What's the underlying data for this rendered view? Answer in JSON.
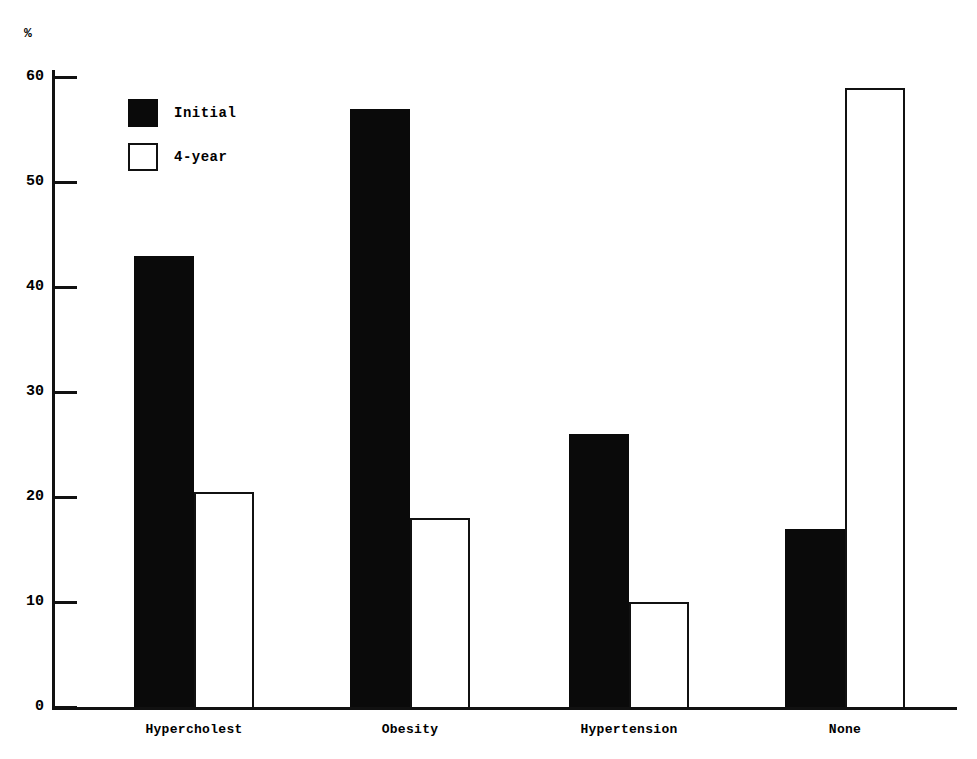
{
  "chart_data": {
    "type": "bar",
    "title": "",
    "xlabel": "",
    "ylabel": "%",
    "ylim": [
      0,
      60
    ],
    "yticks": [
      0,
      10,
      20,
      30,
      40,
      50,
      60
    ],
    "ytick_labels": [
      "0",
      "10",
      "20",
      "30",
      "40",
      "50",
      "60"
    ],
    "grid": false,
    "legend_position": "upper-left-inside",
    "categories": [
      "Hypercholest",
      "Obesity",
      "Hypertension",
      "None"
    ],
    "series": [
      {
        "name": "Initial",
        "style": "filled-black",
        "color": "#0a0a0a",
        "values": [
          43.0,
          57.0,
          26.0,
          17.0
        ]
      },
      {
        "name": "4-year",
        "style": "hollow-outline",
        "color": "#ffffff",
        "edgecolor": "#111111",
        "values": [
          20.5,
          18.0,
          10.0,
          59.0
        ]
      }
    ]
  },
  "axis": {
    "unit_label": "%"
  },
  "legend": {
    "items": [
      {
        "label": "Initial",
        "swatch": "filled"
      },
      {
        "label": "4-year",
        "swatch": "hollow"
      }
    ]
  }
}
